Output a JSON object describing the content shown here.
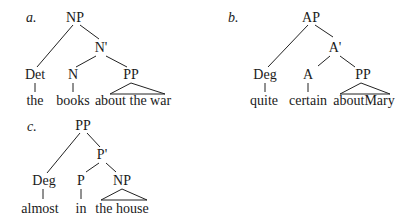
{
  "trees": [
    {
      "id": "a",
      "label": "a.",
      "root": "NP",
      "bar": "N'",
      "spec": "Det",
      "head": "N",
      "comp": "PP",
      "leaves": {
        "spec": "the",
        "head": "books",
        "comp": "about the war"
      }
    },
    {
      "id": "b",
      "label": "b.",
      "root": "AP",
      "bar": "A'",
      "spec": "Deg",
      "head": "A",
      "comp": "PP",
      "leaves": {
        "spec": "quite",
        "head": "certain",
        "comp": "aboutMary"
      }
    },
    {
      "id": "c",
      "label": "c.",
      "root": "PP",
      "bar": "P'",
      "spec": "Deg",
      "head": "P",
      "comp": "NP",
      "leaves": {
        "spec": "almost",
        "head": "in",
        "comp": "the house"
      }
    }
  ]
}
